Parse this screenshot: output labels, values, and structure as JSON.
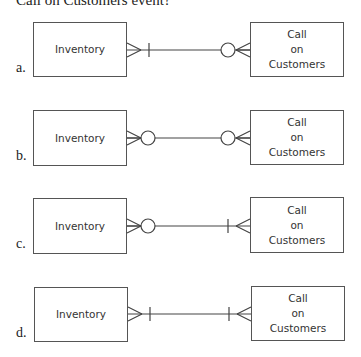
{
  "prompt": "Call on Customers event?",
  "options": [
    {
      "label": "a.",
      "left_entity": "Inventory",
      "right_entity": [
        "Call",
        "on",
        "Customers"
      ],
      "left_end": {
        "crowsfoot": true,
        "marker": "bar"
      },
      "right_end": {
        "crowsfoot": true,
        "marker": "circle"
      }
    },
    {
      "label": "b.",
      "left_entity": "Inventory",
      "right_entity": [
        "Call",
        "on",
        "Customers"
      ],
      "left_end": {
        "crowsfoot": true,
        "marker": "circle"
      },
      "right_end": {
        "crowsfoot": true,
        "marker": "circle"
      }
    },
    {
      "label": "c.",
      "left_entity": "Inventory",
      "right_entity": [
        "Call",
        "on",
        "Customers"
      ],
      "left_end": {
        "crowsfoot": true,
        "marker": "circle"
      },
      "right_end": {
        "crowsfoot": true,
        "marker": "bar"
      }
    },
    {
      "label": "d.",
      "left_entity": "Inventory",
      "right_entity": [
        "Call",
        "on",
        "Customers"
      ],
      "left_end": {
        "crowsfoot": true,
        "marker": "bar"
      },
      "right_end": {
        "crowsfoot": true,
        "marker": "bar"
      }
    }
  ]
}
